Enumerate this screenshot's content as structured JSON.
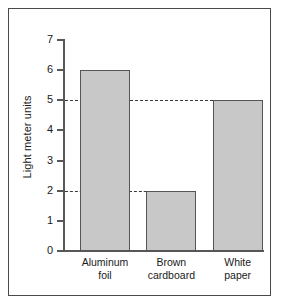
{
  "chart_data": {
    "type": "bar",
    "title": "",
    "xlabel": "",
    "ylabel": "Light meter units",
    "categories": [
      "Aluminum foil",
      "Brown cardboard",
      "White paper"
    ],
    "category_lines": [
      [
        "Aluminum",
        "foil"
      ],
      [
        "Brown",
        "cardboard"
      ],
      [
        "White",
        "paper"
      ]
    ],
    "values": [
      6,
      2,
      5
    ],
    "ylim": [
      0,
      7
    ],
    "yticks": [
      0,
      1,
      2,
      3,
      4,
      5,
      6,
      7
    ],
    "ytick_labels": [
      "0",
      "1",
      "2",
      "3",
      "4",
      "5",
      "6",
      "7"
    ],
    "grid": false,
    "legend": false,
    "reference_lines": [
      {
        "value": 5,
        "style": "dashed",
        "from_axis_to_category": "White paper"
      },
      {
        "value": 2,
        "style": "dashed",
        "from_axis_to_category": "Brown cardboard"
      }
    ],
    "colors": {
      "bar_fill": "#c8c8c8",
      "bar_stroke": "#555555",
      "axis": "#585858",
      "text": "#1a1a1a",
      "reference_line": "#3a3a3a",
      "frame_border": "#4a4a4a",
      "background": "#ffffff"
    }
  }
}
